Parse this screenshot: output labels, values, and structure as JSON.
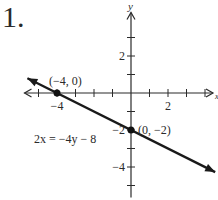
{
  "problem_number": "1.",
  "chart_data": {
    "type": "line",
    "title": "",
    "xlabel": "x",
    "ylabel": "y",
    "xlim": [
      -5,
      4
    ],
    "ylim": [
      -5,
      3
    ],
    "x_ticks": [
      -5,
      -4,
      -3,
      -2,
      -1,
      1,
      2,
      3,
      4
    ],
    "y_ticks": [
      -5,
      -4,
      -3,
      -2,
      -1,
      1,
      2,
      3
    ],
    "x_tick_labels": [
      {
        "value": -4,
        "label": "−4"
      },
      {
        "value": 2,
        "label": "2"
      }
    ],
    "y_tick_labels": [
      {
        "value": 2,
        "label": "2"
      },
      {
        "value": -2,
        "label": "−2"
      },
      {
        "value": -4,
        "label": "−4"
      }
    ],
    "grid": false,
    "series": [
      {
        "name": "2x = -4y - 8",
        "equation": "2x = −4y − 8",
        "slope": -0.5,
        "intercept": -2,
        "x_range": [
          -5,
          4.5
        ],
        "color": "#1a1a1a"
      }
    ],
    "points": [
      {
        "x": -4,
        "y": 0,
        "label": "(−4, 0)"
      },
      {
        "x": 0,
        "y": -2,
        "label": "(0, −2)"
      }
    ],
    "annotations": [
      {
        "text": "2x = −4y − 8",
        "near": "left-middle"
      }
    ]
  }
}
